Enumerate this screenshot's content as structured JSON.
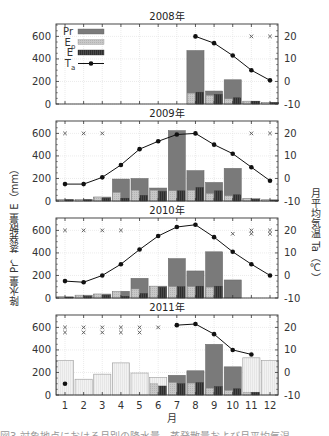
{
  "labels": {
    "ylabel_left": "降水量 Pr，蒸発散量 E（mm）",
    "ylabel_right": "月平均気温 Ta（℃）",
    "xlabel": "月",
    "caption": "図3  対象地点における月別の降水量、蒸発散量および月平均気温"
  },
  "colors": {
    "Pr": "#7a7a7a",
    "Pr_estimated": "#f2f2f2",
    "Ep": "#c8c8c8",
    "E": "#4a4a4a",
    "Ta": "#111111",
    "grid": "#dddddd"
  },
  "chart_data": [
    {
      "type": "bar",
      "title": "2008年",
      "categories": [
        "1",
        "2",
        "3",
        "4",
        "5",
        "6",
        "7",
        "8",
        "9",
        "10",
        "11",
        "12"
      ],
      "xlabel": "月",
      "ylabel": "降水量 Pr，蒸発散量 E（mm）",
      "ylabel_right": "月平均気温 Ta（℃）",
      "ylim": [
        0,
        710
      ],
      "ylim_right": [
        -10,
        25.5
      ],
      "yticks": [
        0,
        200,
        400,
        600
      ],
      "yticks_right": [
        -10,
        0,
        10,
        20
      ],
      "grid": true,
      "legend": {
        "position": "upper-left",
        "entries": [
          "Pr",
          "Ep",
          "E",
          "Ta"
        ]
      },
      "series": [
        {
          "name": "Pr",
          "kind": "bar",
          "values": [
            null,
            null,
            null,
            null,
            null,
            null,
            null,
            475,
            115,
            215,
            25,
            15
          ]
        },
        {
          "name": "Ep",
          "kind": "bar",
          "values": [
            null,
            null,
            null,
            null,
            null,
            null,
            null,
            95,
            75,
            45,
            25,
            15
          ]
        },
        {
          "name": "E",
          "kind": "bar",
          "values": [
            null,
            null,
            null,
            null,
            null,
            null,
            null,
            105,
            85,
            55,
            25,
            12
          ]
        },
        {
          "name": "Ta",
          "kind": "line",
          "axis": "right",
          "values": [
            null,
            null,
            null,
            null,
            null,
            null,
            null,
            20,
            17,
            11.5,
            5,
            0.5
          ]
        }
      ],
      "missing_markers": [
        {
          "month": 11,
          "y": 600
        },
        {
          "month": 12,
          "y": 600
        }
      ]
    },
    {
      "type": "bar",
      "title": "2009年",
      "categories": [
        "1",
        "2",
        "3",
        "4",
        "5",
        "6",
        "7",
        "8",
        "9",
        "10",
        "11",
        "12"
      ],
      "ylim": [
        0,
        710
      ],
      "ylim_right": [
        -10,
        25.5
      ],
      "yticks": [
        0,
        200,
        400,
        600
      ],
      "yticks_right": [
        -10,
        0,
        10,
        20
      ],
      "grid": true,
      "series": [
        {
          "name": "Pr",
          "kind": "bar",
          "values": [
            15,
            15,
            35,
            195,
            200,
            115,
            625,
            270,
            165,
            290,
            20,
            10
          ]
        },
        {
          "name": "Ep",
          "kind": "bar",
          "values": [
            15,
            15,
            35,
            75,
            95,
            95,
            90,
            95,
            65,
            45,
            20,
            10
          ]
        },
        {
          "name": "E",
          "kind": "bar",
          "values": [
            10,
            10,
            25,
            25,
            50,
            85,
            90,
            120,
            90,
            55,
            15,
            8
          ]
        },
        {
          "name": "Ta",
          "kind": "line",
          "axis": "right",
          "values": [
            -2.5,
            -2.5,
            0.5,
            6,
            13,
            16.5,
            19.5,
            20,
            15,
            11,
            5,
            -1
          ]
        }
      ],
      "missing_markers": [
        {
          "month": 1,
          "y": 600
        },
        {
          "month": 2,
          "y": 600
        },
        {
          "month": 3,
          "y": 600
        },
        {
          "month": 11,
          "y": 600
        },
        {
          "month": 12,
          "y": 600
        }
      ]
    },
    {
      "type": "bar",
      "title": "2010年",
      "categories": [
        "1",
        "2",
        "3",
        "4",
        "5",
        "6",
        "7",
        "8",
        "9",
        "10",
        "11",
        "12"
      ],
      "ylim": [
        0,
        710
      ],
      "ylim_right": [
        -10,
        25.5
      ],
      "yticks": [
        0,
        200,
        400,
        600
      ],
      "yticks_right": [
        -10,
        0,
        10,
        20
      ],
      "grid": true,
      "series": [
        {
          "name": "Pr",
          "kind": "bar",
          "values": [
            10,
            25,
            35,
            60,
            175,
            105,
            350,
            240,
            410,
            160,
            null,
            null
          ]
        },
        {
          "name": "Ep",
          "kind": "bar",
          "values": [
            10,
            25,
            35,
            60,
            80,
            105,
            100,
            100,
            95,
            null,
            null,
            null
          ]
        },
        {
          "name": "E",
          "kind": "bar",
          "values": [
            8,
            15,
            25,
            15,
            40,
            95,
            100,
            105,
            105,
            null,
            null,
            null
          ]
        },
        {
          "name": "Ta",
          "kind": "line",
          "axis": "right",
          "values": [
            -2.5,
            -3,
            0,
            5,
            11.5,
            17.5,
            21.5,
            22.5,
            17,
            10.5,
            5,
            0
          ]
        }
      ],
      "missing_markers": [
        {
          "month": 1,
          "y": 600
        },
        {
          "month": 2,
          "y": 600
        },
        {
          "month": 3,
          "y": 600
        },
        {
          "month": 4,
          "y": 600
        },
        {
          "month": 10,
          "y": 570
        },
        {
          "month": 11,
          "y": 600
        },
        {
          "month": 11,
          "y": 570
        },
        {
          "month": 12,
          "y": 600
        },
        {
          "month": 12,
          "y": 570
        }
      ]
    },
    {
      "type": "bar",
      "title": "2011年",
      "categories": [
        "1",
        "2",
        "3",
        "4",
        "5",
        "6",
        "7",
        "8",
        "9",
        "10",
        "11",
        "12"
      ],
      "ylim": [
        0,
        710
      ],
      "ylim_right": [
        -10,
        25.5
      ],
      "yticks": [
        0,
        200,
        400,
        600
      ],
      "yticks_right": [
        -10,
        0,
        10,
        20
      ],
      "grid": true,
      "series": [
        {
          "name": "Pr",
          "kind": "bar",
          "values": [
            null,
            null,
            null,
            null,
            null,
            null,
            175,
            215,
            450,
            250,
            null,
            null
          ]
        },
        {
          "name": "Pr (estimated, light)",
          "kind": "bar",
          "values": [
            305,
            140,
            185,
            285,
            195,
            155,
            null,
            null,
            null,
            null,
            330,
            305
          ]
        },
        {
          "name": "Ep",
          "kind": "bar",
          "values": [
            null,
            null,
            null,
            null,
            null,
            100,
            110,
            105,
            60,
            40,
            25,
            null
          ]
        },
        {
          "name": "E",
          "kind": "bar",
          "values": [
            null,
            null,
            null,
            null,
            null,
            80,
            100,
            110,
            75,
            55,
            25,
            null
          ]
        },
        {
          "name": "Ta",
          "kind": "line",
          "axis": "right",
          "values": [
            -5,
            null,
            null,
            null,
            null,
            null,
            21,
            21.5,
            17,
            10,
            8,
            null
          ]
        }
      ],
      "missing_markers": [
        {
          "month": 1,
          "y": 600
        },
        {
          "month": 1,
          "y": 555
        },
        {
          "month": 2,
          "y": 600
        },
        {
          "month": 2,
          "y": 555
        },
        {
          "month": 3,
          "y": 600
        },
        {
          "month": 3,
          "y": 555
        },
        {
          "month": 4,
          "y": 600
        },
        {
          "month": 4,
          "y": 555
        },
        {
          "month": 5,
          "y": 600
        },
        {
          "month": 5,
          "y": 555
        },
        {
          "month": 6,
          "y": 600
        }
      ]
    }
  ]
}
